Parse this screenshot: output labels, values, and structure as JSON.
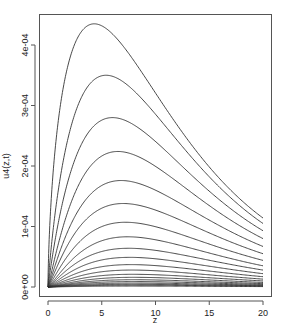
{
  "chart_data": {
    "type": "line",
    "title": "",
    "xlabel": "z",
    "ylabel": "u4(z,t)",
    "xlim": [
      0,
      20
    ],
    "ylim": [
      0,
      0.00045
    ],
    "x_ticks": [
      0,
      5,
      10,
      15,
      20
    ],
    "x_tick_labels": [
      "0",
      "5",
      "10",
      "15",
      "20"
    ],
    "y_ticks": [
      0,
      0.0001,
      0.0002,
      0.0003,
      0.0004
    ],
    "y_tick_labels": [
      "0e+00",
      "1e-04",
      "2e-04",
      "3e-04",
      "4e-04"
    ],
    "grid": false,
    "legend": null,
    "line_color": "#333333",
    "series_description": "Family of ~20 curves, each rising steeply from 0 at z=0 to a peak and decaying toward z=20; peaks decrease roughly geometrically and shift right",
    "series": [
      {
        "name": "curve-1",
        "peak_z": 4.3,
        "peak_u": 0.000435,
        "u_at_20": 0.000114
      },
      {
        "name": "curve-2",
        "peak_z": 5.4,
        "peak_u": 0.00035,
        "u_at_20": 0.000105
      },
      {
        "name": "curve-3",
        "peak_z": 6.0,
        "peak_u": 0.00028,
        "u_at_20": 9.3e-05
      },
      {
        "name": "curve-4",
        "peak_z": 6.5,
        "peak_u": 0.000224,
        "u_at_20": 8e-05
      },
      {
        "name": "curve-5",
        "peak_z": 6.8,
        "peak_u": 0.000176,
        "u_at_20": 6.7e-05
      },
      {
        "name": "curve-6",
        "peak_z": 7.0,
        "peak_u": 0.000138,
        "u_at_20": 5.5e-05
      },
      {
        "name": "curve-7",
        "peak_z": 7.2,
        "peak_u": 0.000107,
        "u_at_20": 4.4e-05
      },
      {
        "name": "curve-8",
        "peak_z": 7.4,
        "peak_u": 8.3e-05,
        "u_at_20": 3.5e-05
      },
      {
        "name": "curve-9",
        "peak_z": 7.5,
        "peak_u": 6.4e-05,
        "u_at_20": 2.8e-05
      },
      {
        "name": "curve-10",
        "peak_z": 7.6,
        "peak_u": 4.9e-05,
        "u_at_20": 2.2e-05
      },
      {
        "name": "curve-11",
        "peak_z": 7.7,
        "peak_u": 3.7e-05,
        "u_at_20": 1.7e-05
      },
      {
        "name": "curve-12",
        "peak_z": 7.8,
        "peak_u": 2.8e-05,
        "u_at_20": 1.3e-05
      },
      {
        "name": "curve-13",
        "peak_z": 7.9,
        "peak_u": 2.1e-05,
        "u_at_20": 1e-05
      },
      {
        "name": "curve-14",
        "peak_z": 8.0,
        "peak_u": 1.6e-05,
        "u_at_20": 7.5e-06
      },
      {
        "name": "curve-15",
        "peak_z": 8.0,
        "peak_u": 1.2e-05,
        "u_at_20": 5.6e-06
      },
      {
        "name": "curve-16",
        "peak_z": 8.0,
        "peak_u": 9e-06,
        "u_at_20": 4.2e-06
      },
      {
        "name": "curve-17",
        "peak_z": 8.0,
        "peak_u": 6.5e-06,
        "u_at_20": 3e-06
      },
      {
        "name": "curve-18",
        "peak_z": 8.0,
        "peak_u": 4.5e-06,
        "u_at_20": 2.1e-06
      },
      {
        "name": "curve-19",
        "peak_z": 8.0,
        "peak_u": 3e-06,
        "u_at_20": 1.4e-06
      },
      {
        "name": "curve-20",
        "peak_z": 8.0,
        "peak_u": 1.5e-06,
        "u_at_20": 7e-07
      }
    ]
  }
}
